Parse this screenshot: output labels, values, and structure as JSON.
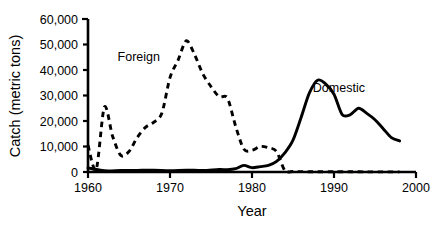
{
  "chart_data": {
    "type": "line",
    "title": "",
    "subtitle": "",
    "xlabel": "Year",
    "ylabel": "Catch (metric tons)",
    "xlim": [
      1960,
      2000
    ],
    "ylim": [
      0,
      60000
    ],
    "xticks": [
      1960,
      1970,
      1980,
      1990,
      2000
    ],
    "xtick_labels": [
      "1960",
      "1970",
      "1980",
      "1990",
      "2000"
    ],
    "yticks": [
      0,
      10000,
      20000,
      30000,
      40000,
      50000,
      60000
    ],
    "ytick_labels": [
      "0",
      "10,000",
      "20,000",
      "30,000",
      "40,000",
      "50,000",
      "60,000"
    ],
    "grid": false,
    "legend": "inline-annotations",
    "series": [
      {
        "name": "Foreign",
        "style": "dashed",
        "color": "#000000",
        "label_position": {
          "x": 1966.2,
          "y": 43500
        },
        "x": [
          1960,
          1961,
          1962,
          1963,
          1964,
          1965,
          1966,
          1967,
          1968,
          1969,
          1970,
          1971,
          1972,
          1973,
          1974,
          1975,
          1976,
          1977,
          1978,
          1979,
          1980,
          1981,
          1982,
          1983,
          1984,
          1985,
          1986,
          1987,
          1988,
          1990,
          1992,
          1994,
          1996,
          1998
        ],
        "values": [
          10500,
          1000,
          25500,
          14000,
          6500,
          8000,
          13500,
          17500,
          19500,
          23000,
          37000,
          44000,
          51500,
          46000,
          38500,
          33500,
          29500,
          29000,
          18000,
          9000,
          8500,
          10000,
          9500,
          8000,
          600,
          200,
          150,
          120,
          100,
          80,
          80,
          60,
          60,
          50
        ]
      },
      {
        "name": "Domestic",
        "style": "solid",
        "color": "#000000",
        "label_position": {
          "x": 1990.6,
          "y": 31500
        },
        "x": [
          1960,
          1962,
          1964,
          1966,
          1968,
          1970,
          1972,
          1974,
          1976,
          1977,
          1978,
          1979,
          1980,
          1981,
          1982,
          1983,
          1984,
          1985,
          1986,
          1987,
          1988,
          1989,
          1990,
          1991,
          1992,
          1993,
          1994,
          1995,
          1996,
          1997,
          1998
        ],
        "values": [
          1600,
          500,
          600,
          650,
          700,
          500,
          750,
          600,
          1000,
          900,
          1300,
          2600,
          1700,
          2100,
          2600,
          4200,
          7500,
          12500,
          21500,
          31000,
          36000,
          34500,
          30500,
          22500,
          22500,
          25000,
          23000,
          20500,
          17000,
          13500,
          12200
        ]
      }
    ]
  }
}
